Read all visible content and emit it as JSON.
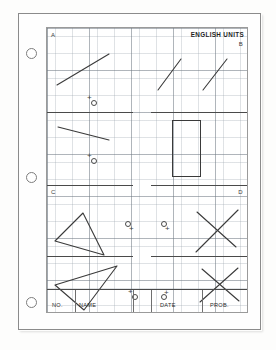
{
  "document": {
    "kind": "drafting-worksheet",
    "units_label": "ENGLISH UNITS",
    "quadrant_labels": {
      "a": "A",
      "b": "B",
      "c": "C",
      "d": "D"
    },
    "title_block": {
      "number_label": "NO.",
      "name_label": "NAME",
      "date_label": "DATE",
      "problem_label": "PROB."
    },
    "colors": {
      "paper": "#fefefe",
      "grid_fine": "#96a0aa",
      "grid_major": "#6e7882",
      "ink": "#3a3a3a",
      "rule": "#4a4a4a",
      "border": "#8b8b8b"
    },
    "punch_holes": [
      {
        "label": "punch-hole-top"
      },
      {
        "label": "punch-hole-middle"
      },
      {
        "label": "punch-hole-bottom"
      }
    ],
    "figures": {
      "a_line": "ascending-straight-line",
      "a_mark": "plus-with-circle",
      "b_line_left": "ascending-straight-line",
      "b_line_right": "ascending-straight-line",
      "row2_line": "descending-straight-line",
      "row2_mark": "plus-with-circle",
      "row2_rect": "vertical-rectangle",
      "c_triangle": "triangle-apex-up",
      "c_mark": "circle-with-plus",
      "d_mark": "circle-with-plus",
      "d_cross": "x-crossed-lines",
      "row4_triangle": "triangle-pointing-right",
      "row4_mark": "plus-with-circle",
      "row4_mark_right": "circle-with-plus",
      "row4_cross": "x-crossed-lines"
    }
  }
}
